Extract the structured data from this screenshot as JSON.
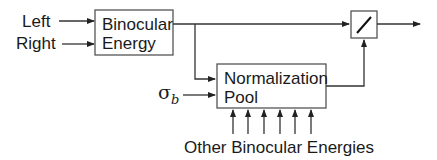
{
  "diagram": {
    "inputs": {
      "left": "Left",
      "right": "Right",
      "sigma": "σ",
      "sigma_sub": "b"
    },
    "blocks": {
      "binocular_energy": {
        "line1": "Binocular",
        "line2": "Energy"
      },
      "normalization_pool": {
        "line1": "Normalization",
        "line2": "Pool"
      },
      "divider": {
        "symbol": "division-slash"
      }
    },
    "bottom_label": "Other Binocular Energies",
    "arrow_count_bottom": 6,
    "colors": {
      "line": "#333333",
      "box_border": "#555555",
      "text": "#1a1a1a"
    }
  }
}
